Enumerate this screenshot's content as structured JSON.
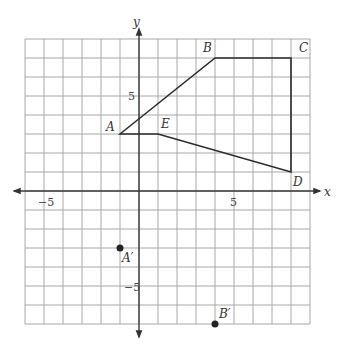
{
  "diagram": {
    "type": "coordinate-grid",
    "x_range": [
      -6,
      9
    ],
    "y_range": [
      -7,
      8
    ],
    "axis_labels": {
      "x": "x",
      "y": "y"
    },
    "ticks": {
      "x_neg": "−5",
      "x_pos": "5",
      "y_pos": "5",
      "y_neg": "−5"
    },
    "polygon": {
      "vertices": [
        {
          "label": "A",
          "x": -1,
          "y": 3
        },
        {
          "label": "B",
          "x": 4,
          "y": 7
        },
        {
          "label": "C",
          "x": 8,
          "y": 7
        },
        {
          "label": "D",
          "x": 8,
          "y": 1
        },
        {
          "label": "E",
          "x": 1,
          "y": 3
        }
      ]
    },
    "points": [
      {
        "label": "A′",
        "x": -1,
        "y": -3
      },
      {
        "label": "B′",
        "x": 4,
        "y": -7
      }
    ]
  }
}
